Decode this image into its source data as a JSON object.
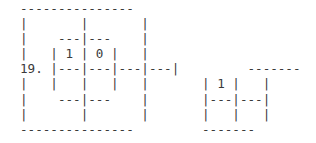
{
  "figure": {
    "label": "19.",
    "lines": [
      "---------------",
      "|       |       |",
      "|    ---|---    |",
      "|   | 1 | 0 |   |",
      "19. |---|---|---|---|         -------",
      "|   |   |   |   |       | 1 |   |",
      "|    ---|---    |       |---|---|",
      "|       |       |       |   |   |",
      "---------------         -------"
    ],
    "cell_values": {
      "left_grid": [
        "1",
        "0"
      ],
      "right_grid": [
        "1"
      ]
    },
    "text_color": "#3a3a3a",
    "background_color": "#ffffff"
  }
}
